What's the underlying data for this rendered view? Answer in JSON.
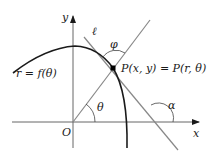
{
  "diagram": {
    "axes": {
      "x_label": "x",
      "y_label": "y",
      "origin_label": "O"
    },
    "curve": {
      "label": "r = f(θ)"
    },
    "tangent": {
      "label": "ℓ"
    },
    "point": {
      "label": "P(x, y) = P(r, θ)"
    },
    "angles": {
      "theta": "θ",
      "phi": "φ",
      "alpha": "α"
    },
    "colors": {
      "axis": "#555555",
      "curve": "#1a1a1a",
      "lines": "#777777",
      "point": "#000000"
    }
  }
}
